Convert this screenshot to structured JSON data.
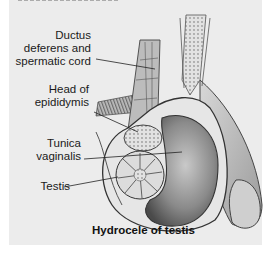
{
  "figure": {
    "caption": "Hydrocele of testis",
    "labels": [
      {
        "id": "ductus",
        "lines": [
          "Ductus",
          "deferens and",
          "spermatic cord"
        ]
      },
      {
        "id": "epididymis",
        "lines": [
          "Head of",
          "epididymis"
        ]
      },
      {
        "id": "tunica",
        "lines": [
          "Tunica",
          "vaginalis"
        ]
      },
      {
        "id": "testis",
        "lines": [
          "Testis"
        ]
      }
    ]
  },
  "colors": {
    "panel": "#ececec",
    "outline": "#3a3a3a",
    "fluid_dark": "#5c5c5c",
    "fluid_light": "#b5b5b5"
  }
}
